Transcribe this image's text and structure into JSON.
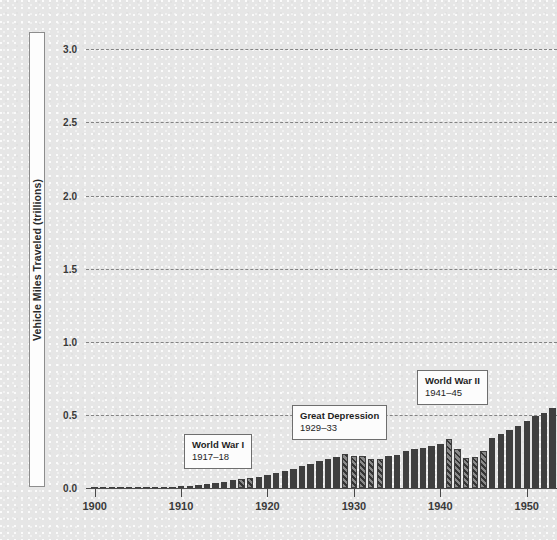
{
  "chart_data": {
    "type": "bar",
    "title": "",
    "subtitle": "",
    "xlabel": "",
    "ylabel": "Vehicle Miles Traveled (trillions)",
    "xlim": [
      1899,
      1953.5
    ],
    "ylim": [
      0.0,
      3.2
    ],
    "grid": true,
    "legend_position": "none",
    "y_ticks": [
      {
        "value": 0.0,
        "label": "0.0"
      },
      {
        "value": 0.5,
        "label": "0.5"
      },
      {
        "value": 1.0,
        "label": "1.0"
      },
      {
        "value": 1.5,
        "label": "1.5"
      },
      {
        "value": 2.0,
        "label": "2.0"
      },
      {
        "value": 2.5,
        "label": "2.5"
      },
      {
        "value": 3.0,
        "label": "3.0"
      }
    ],
    "x_ticks": [
      {
        "value": 1900,
        "label": "1900"
      },
      {
        "value": 1910,
        "label": "1910"
      },
      {
        "value": 1920,
        "label": "1920"
      },
      {
        "value": 1930,
        "label": "1930"
      },
      {
        "value": 1940,
        "label": "1940"
      },
      {
        "value": 1950,
        "label": "1950"
      }
    ],
    "bar_styles": {
      "normal": {
        "name": "solid",
        "color": "#3f3f3f"
      },
      "highlight": {
        "name": "hatched",
        "color": "#8a8a8a",
        "hatch": "diagonal-45"
      }
    },
    "x": [
      1900,
      1901,
      1902,
      1903,
      1904,
      1905,
      1906,
      1907,
      1908,
      1909,
      1910,
      1911,
      1912,
      1913,
      1914,
      1915,
      1916,
      1917,
      1918,
      1919,
      1920,
      1921,
      1922,
      1923,
      1924,
      1925,
      1926,
      1927,
      1928,
      1929,
      1930,
      1931,
      1932,
      1933,
      1934,
      1935,
      1936,
      1937,
      1938,
      1939,
      1940,
      1941,
      1942,
      1943,
      1944,
      1945,
      1946,
      1947,
      1948,
      1949,
      1950,
      1951,
      1952,
      1953
    ],
    "values": [
      0.001,
      0.001,
      0.002,
      0.002,
      0.003,
      0.004,
      0.005,
      0.006,
      0.008,
      0.01,
      0.013,
      0.017,
      0.022,
      0.028,
      0.035,
      0.043,
      0.052,
      0.062,
      0.068,
      0.078,
      0.089,
      0.101,
      0.116,
      0.132,
      0.148,
      0.165,
      0.182,
      0.198,
      0.213,
      0.232,
      0.221,
      0.216,
      0.2,
      0.201,
      0.216,
      0.229,
      0.252,
      0.27,
      0.271,
      0.285,
      0.302,
      0.334,
      0.268,
      0.208,
      0.213,
      0.25,
      0.341,
      0.371,
      0.398,
      0.424,
      0.458,
      0.491,
      0.514,
      0.544
    ],
    "highlighted": [
      1917,
      1918,
      1929,
      1930,
      1931,
      1932,
      1933,
      1941,
      1942,
      1943,
      1944,
      1945
    ],
    "annotations": [
      {
        "id": "world-war-1",
        "title": "World War I",
        "years": "1917–18",
        "x_left": 184,
        "y_top": 434
      },
      {
        "id": "great-depression",
        "title": "Great Depression",
        "years": "1929–33",
        "x_left": 292,
        "y_top": 405
      },
      {
        "id": "world-war-2",
        "title": "World War II",
        "years": "1941–45",
        "x_left": 417,
        "y_top": 370
      }
    ]
  }
}
